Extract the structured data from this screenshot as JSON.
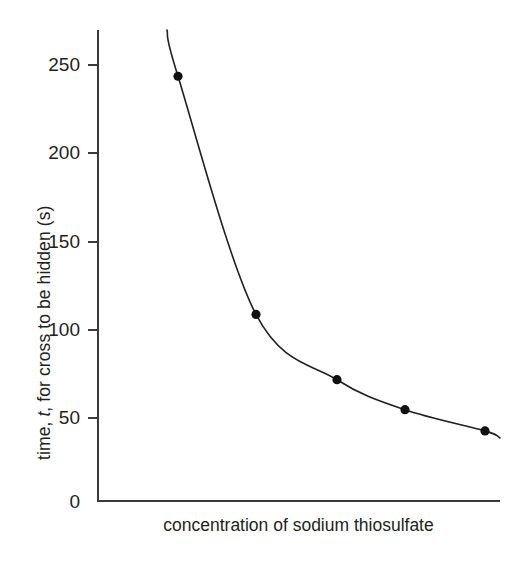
{
  "chart_data": {
    "type": "line",
    "title": "",
    "subtitle": "",
    "xlabel": "concentration of sodium thiosulfate",
    "ylabel": "time, t, for cross to be hidden (s)",
    "ylabel_parts": {
      "prefix": "time, ",
      "italic": "t",
      "suffix": ", for cross to be hidden (s)"
    },
    "x": [
      1,
      2,
      3,
      4,
      5
    ],
    "values": [
      243,
      108,
      71,
      54,
      42
    ],
    "series": [
      {
        "name": "time for cross to be hidden",
        "values": [
          243,
          108,
          71,
          54,
          42
        ]
      }
    ],
    "points": [
      {
        "x": 1,
        "y": 243
      },
      {
        "x": 2,
        "y": 108
      },
      {
        "x": 3,
        "y": 71
      },
      {
        "x": 4,
        "y": 54
      },
      {
        "x": 5,
        "y": 42
      }
    ],
    "yticks": [
      0,
      50,
      100,
      150,
      200,
      250
    ],
    "ytick_labels": [
      "0",
      "50",
      "100",
      "150",
      "200",
      "250"
    ],
    "xticks": [],
    "xtick_labels": [],
    "ylim": [
      0,
      270
    ],
    "xlim": [
      0,
      1
    ],
    "grid": false,
    "legend": false,
    "legend_position": "none",
    "marker": "filled-circle",
    "curve_style": "smooth-decreasing-inverse",
    "annotations": [],
    "colors": {
      "axis": "#3a3a3c",
      "curve": "#231f20",
      "marker": "#111111",
      "text": "#231f20",
      "background": "#ffffff"
    }
  },
  "figure": {
    "axis_title_y": "time, t, for cross to be hidden (s)",
    "axis_title_x": "concentration of sodium thiosulfate"
  }
}
